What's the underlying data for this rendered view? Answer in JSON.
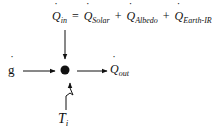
{
  "diagram": {
    "equation": {
      "lhs": {
        "symbol": "Q",
        "subscript": "in"
      },
      "equals": "=",
      "terms": [
        {
          "symbol": "Q",
          "subscript": "Solar"
        },
        {
          "symbol": "Q",
          "subscript": "Albedo"
        },
        {
          "symbol": "Q",
          "subscript": "Earth-IR"
        }
      ],
      "plus": "+"
    },
    "inputs": {
      "generation": {
        "symbol": "g"
      },
      "temperature": {
        "symbol": "T",
        "subscript": "i"
      }
    },
    "outputs": {
      "heat_out": {
        "symbol": "Q",
        "subscript": "out"
      }
    },
    "colors": {
      "stroke": "#111111",
      "background": "#ffffff"
    }
  }
}
